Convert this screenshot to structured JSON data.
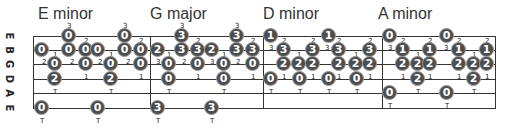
{
  "strings": [
    "E",
    "B",
    "G",
    "D",
    "A",
    "E"
  ],
  "string_y": [
    36,
    50,
    64,
    79,
    93,
    108
  ],
  "frame": {
    "left": 33,
    "right": 495,
    "top": 36,
    "bottom": 108,
    "separators": [
      150,
      263,
      382
    ]
  },
  "colors": {
    "dot_fill": "#4d4d4d",
    "dot_border": "#9a9a9a",
    "line": "#333333",
    "text": "#333333"
  },
  "chords": [
    {
      "name": "E minor",
      "title_x": 38,
      "dots": [
        {
          "x": 69,
          "s": 0,
          "n": "0"
        },
        {
          "x": 125,
          "s": 0,
          "n": "0"
        },
        {
          "x": 42,
          "s": 1,
          "n": "0"
        },
        {
          "x": 69,
          "s": 1,
          "n": "0"
        },
        {
          "x": 86,
          "s": 1,
          "n": "0"
        },
        {
          "x": 98,
          "s": 1,
          "n": "0"
        },
        {
          "x": 125,
          "s": 1,
          "n": "0"
        },
        {
          "x": 141,
          "s": 1,
          "n": "0"
        },
        {
          "x": 55,
          "s": 2,
          "n": "0"
        },
        {
          "x": 86,
          "s": 2,
          "n": "0"
        },
        {
          "x": 111,
          "s": 2,
          "n": "0"
        },
        {
          "x": 141,
          "s": 2,
          "n": "0"
        },
        {
          "x": 55,
          "s": 3,
          "n": "2"
        },
        {
          "x": 111,
          "s": 3,
          "n": "2"
        },
        {
          "x": 42,
          "s": 5,
          "n": "0"
        },
        {
          "x": 98,
          "s": 5,
          "n": "0"
        }
      ],
      "annotations": [
        {
          "x": 69,
          "y": 22,
          "t": "3"
        },
        {
          "x": 125,
          "y": 22,
          "t": "3"
        },
        {
          "x": 86,
          "y": 37,
          "t": "2"
        },
        {
          "x": 141,
          "y": 37,
          "t": "2"
        },
        {
          "x": 55,
          "y": 51,
          "t": "1"
        },
        {
          "x": 111,
          "y": 51,
          "t": "1"
        },
        {
          "x": 44,
          "y": 58,
          "t": "2"
        },
        {
          "x": 72,
          "y": 58,
          "t": "2"
        },
        {
          "x": 100,
          "y": 58,
          "t": "2"
        },
        {
          "x": 128,
          "y": 58,
          "t": "2"
        },
        {
          "x": 55,
          "y": 88,
          "t": "T"
        },
        {
          "x": 86,
          "y": 73,
          "t": "1"
        },
        {
          "x": 111,
          "y": 88,
          "t": "T"
        },
        {
          "x": 141,
          "y": 73,
          "t": "1"
        },
        {
          "x": 42,
          "y": 117,
          "t": "T"
        },
        {
          "x": 98,
          "y": 117,
          "t": "T"
        }
      ]
    },
    {
      "name": "G major",
      "title_x": 150,
      "dots": [
        {
          "x": 182,
          "s": 0,
          "n": "3"
        },
        {
          "x": 237,
          "s": 0,
          "n": "3"
        },
        {
          "x": 158,
          "s": 1,
          "n": "2"
        },
        {
          "x": 182,
          "s": 1,
          "n": "3"
        },
        {
          "x": 198,
          "s": 1,
          "n": "3"
        },
        {
          "x": 212,
          "s": 1,
          "n": "2"
        },
        {
          "x": 237,
          "s": 1,
          "n": "3"
        },
        {
          "x": 253,
          "s": 1,
          "n": "3"
        },
        {
          "x": 169,
          "s": 2,
          "n": "0"
        },
        {
          "x": 198,
          "s": 2,
          "n": "0"
        },
        {
          "x": 224,
          "s": 2,
          "n": "0"
        },
        {
          "x": 253,
          "s": 2,
          "n": "0"
        },
        {
          "x": 169,
          "s": 3,
          "n": "0"
        },
        {
          "x": 224,
          "s": 3,
          "n": "0"
        },
        {
          "x": 158,
          "s": 5,
          "n": "3"
        },
        {
          "x": 212,
          "s": 5,
          "n": "3"
        }
      ],
      "annotations": [
        {
          "x": 182,
          "y": 22,
          "t": "3"
        },
        {
          "x": 237,
          "y": 22,
          "t": "3"
        },
        {
          "x": 198,
          "y": 37,
          "t": "2"
        },
        {
          "x": 253,
          "y": 37,
          "t": "2"
        },
        {
          "x": 169,
          "y": 51,
          "t": "1"
        },
        {
          "x": 224,
          "y": 51,
          "t": "1"
        },
        {
          "x": 158,
          "y": 58,
          "t": "3"
        },
        {
          "x": 184,
          "y": 58,
          "t": "2"
        },
        {
          "x": 212,
          "y": 58,
          "t": "3"
        },
        {
          "x": 238,
          "y": 58,
          "t": "2"
        },
        {
          "x": 198,
          "y": 73,
          "t": "1"
        },
        {
          "x": 253,
          "y": 73,
          "t": "1"
        },
        {
          "x": 169,
          "y": 88,
          "t": "T"
        },
        {
          "x": 224,
          "y": 88,
          "t": "T"
        },
        {
          "x": 158,
          "y": 117,
          "t": "T"
        },
        {
          "x": 212,
          "y": 117,
          "t": "T"
        }
      ]
    },
    {
      "name": "D minor",
      "title_x": 263,
      "dots": [
        {
          "x": 271,
          "s": 0,
          "n": "1"
        },
        {
          "x": 329,
          "s": 0,
          "n": "1"
        },
        {
          "x": 284,
          "s": 1,
          "n": "3"
        },
        {
          "x": 313,
          "s": 1,
          "n": "3"
        },
        {
          "x": 339,
          "s": 1,
          "n": "3"
        },
        {
          "x": 370,
          "s": 1,
          "n": "3"
        },
        {
          "x": 284,
          "s": 2,
          "n": "2"
        },
        {
          "x": 299,
          "s": 2,
          "n": "2"
        },
        {
          "x": 313,
          "s": 2,
          "n": "2"
        },
        {
          "x": 339,
          "s": 2,
          "n": "2"
        },
        {
          "x": 356,
          "s": 2,
          "n": "2"
        },
        {
          "x": 370,
          "s": 2,
          "n": "2"
        },
        {
          "x": 271,
          "s": 3,
          "n": "0"
        },
        {
          "x": 300,
          "s": 3,
          "n": "0"
        },
        {
          "x": 329,
          "s": 3,
          "n": "0"
        },
        {
          "x": 357,
          "s": 3,
          "n": "0"
        }
      ],
      "annotations": [
        {
          "x": 284,
          "y": 37,
          "t": "2"
        },
        {
          "x": 313,
          "y": 37,
          "t": "2"
        },
        {
          "x": 339,
          "y": 37,
          "t": "2"
        },
        {
          "x": 370,
          "y": 37,
          "t": "2"
        },
        {
          "x": 271,
          "y": 44,
          "t": "3"
        },
        {
          "x": 327,
          "y": 44,
          "t": "3"
        },
        {
          "x": 299,
          "y": 51,
          "t": "1"
        },
        {
          "x": 356,
          "y": 51,
          "t": "1"
        },
        {
          "x": 284,
          "y": 73,
          "t": "1"
        },
        {
          "x": 313,
          "y": 73,
          "t": "1"
        },
        {
          "x": 339,
          "y": 73,
          "t": "1"
        },
        {
          "x": 370,
          "y": 73,
          "t": "1"
        },
        {
          "x": 271,
          "y": 88,
          "t": "T"
        },
        {
          "x": 300,
          "y": 88,
          "t": "T"
        },
        {
          "x": 329,
          "y": 88,
          "t": "T"
        },
        {
          "x": 357,
          "y": 88,
          "t": "T"
        }
      ]
    },
    {
      "name": "A minor",
      "title_x": 378,
      "dots": [
        {
          "x": 390,
          "s": 0,
          "n": "0"
        },
        {
          "x": 447,
          "s": 0,
          "n": "0"
        },
        {
          "x": 403,
          "s": 1,
          "n": "1"
        },
        {
          "x": 430,
          "s": 1,
          "n": "1"
        },
        {
          "x": 459,
          "s": 1,
          "n": "1"
        },
        {
          "x": 487,
          "s": 1,
          "n": "1"
        },
        {
          "x": 403,
          "s": 2,
          "n": "2"
        },
        {
          "x": 418,
          "s": 2,
          "n": "2"
        },
        {
          "x": 430,
          "s": 2,
          "n": "2"
        },
        {
          "x": 459,
          "s": 2,
          "n": "2"
        },
        {
          "x": 474,
          "s": 2,
          "n": "2"
        },
        {
          "x": 487,
          "s": 2,
          "n": "2"
        },
        {
          "x": 418,
          "s": 3,
          "n": "2"
        },
        {
          "x": 474,
          "s": 3,
          "n": "2"
        },
        {
          "x": 390,
          "s": 4,
          "n": "0"
        },
        {
          "x": 447,
          "s": 4,
          "n": "0"
        }
      ],
      "annotations": [
        {
          "x": 403,
          "y": 37,
          "t": "2"
        },
        {
          "x": 430,
          "y": 37,
          "t": "2"
        },
        {
          "x": 459,
          "y": 37,
          "t": "2"
        },
        {
          "x": 487,
          "y": 37,
          "t": "2"
        },
        {
          "x": 390,
          "y": 44,
          "t": "3"
        },
        {
          "x": 446,
          "y": 44,
          "t": "3"
        },
        {
          "x": 418,
          "y": 51,
          "t": "1"
        },
        {
          "x": 474,
          "y": 51,
          "t": "1"
        },
        {
          "x": 403,
          "y": 73,
          "t": "1"
        },
        {
          "x": 430,
          "y": 73,
          "t": "1"
        },
        {
          "x": 459,
          "y": 73,
          "t": "1"
        },
        {
          "x": 487,
          "y": 73,
          "t": "1"
        },
        {
          "x": 418,
          "y": 88,
          "t": "T"
        },
        {
          "x": 474,
          "y": 88,
          "t": "T"
        },
        {
          "x": 390,
          "y": 102,
          "t": "T"
        },
        {
          "x": 447,
          "y": 102,
          "t": "T"
        }
      ]
    }
  ]
}
